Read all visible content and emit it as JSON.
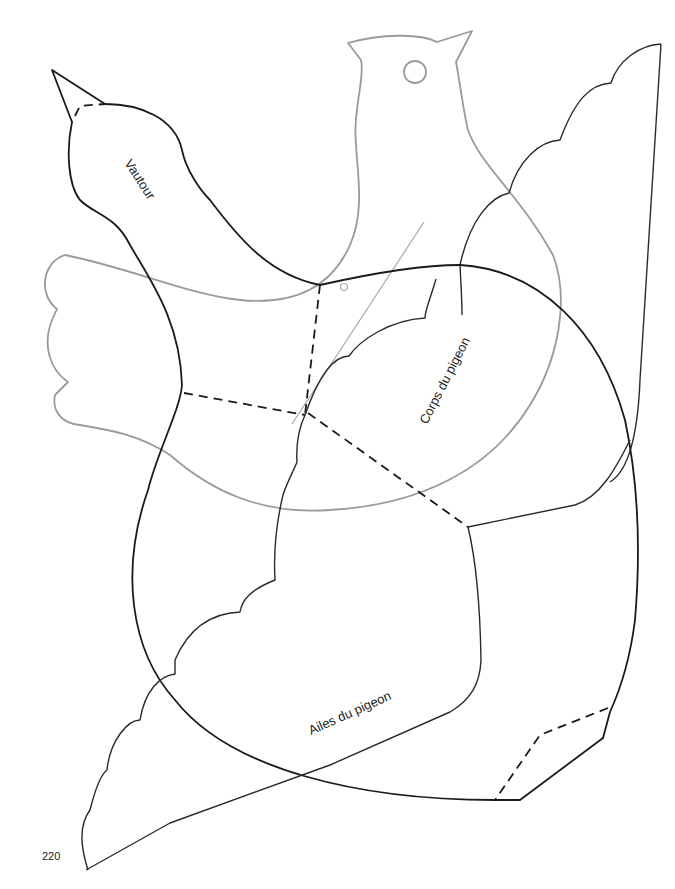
{
  "page": {
    "number": "220",
    "background": "#ffffff"
  },
  "pieces": [
    {
      "id": "vautour",
      "label": "Vautour",
      "stroke": "#1a1a1a"
    },
    {
      "id": "corps-du-pigeon",
      "label": "Corps du pigeon",
      "stroke": "#1a1a1a"
    },
    {
      "id": "ailes-du-pigeon",
      "label": "Ailes du pigeon",
      "stroke": "#1a1a1a"
    },
    {
      "id": "pigeon-outline",
      "label": "",
      "stroke": "#9a9a9a"
    }
  ],
  "legend": {
    "solid_line": "cut line",
    "dashed_line": "fold / overlap line"
  }
}
